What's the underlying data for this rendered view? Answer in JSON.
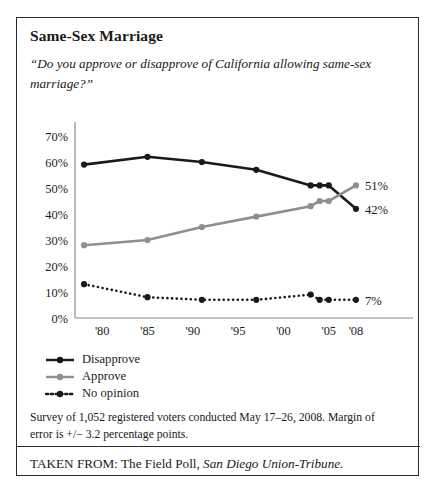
{
  "figure": {
    "title": "Same-Sex Marriage",
    "question": "“Do you approve or disapprove of California allowing same-sex marriage?”",
    "survey_note": "Survey of 1,052 registered voters conducted May 17–26,  2008. Margin of error is +/− 3.2 percentage points.",
    "source_prefix": "TAKEN FROM: The Field Poll, ",
    "source_publication": "San Diego Union-Tribune."
  },
  "colors": {
    "disapprove": "#1a1a1a",
    "approve": "#8f8f8f",
    "no_opinion": "#1a1a1a",
    "axis": "#8a8a8a",
    "frame": "#2b2b2b",
    "text": "#1a1a1a"
  },
  "chart_data": {
    "type": "line",
    "title": "Same-Sex Marriage",
    "subtitle": "“Do you approve or disapprove of California allowing same-sex marriage?”",
    "xlabel": "",
    "ylabel": "",
    "xlim": [
      1977,
      2009
    ],
    "ylim": [
      0,
      70
    ],
    "ytick_labels": [
      "0%",
      "10%",
      "20%",
      "30%",
      "40%",
      "50%",
      "60%",
      "70%"
    ],
    "ytick_values": [
      0,
      10,
      20,
      30,
      40,
      50,
      60,
      70
    ],
    "xtick_labels": [
      "'80",
      "'85",
      "'90",
      "'95",
      "'00",
      "'05",
      "'08"
    ],
    "xtick_values": [
      1980,
      1985,
      1990,
      1995,
      2000,
      2005,
      2008
    ],
    "grid": false,
    "legend_position": "below-left",
    "series": [
      {
        "name": "Disapprove",
        "color": "#1a1a1a",
        "style": "solid",
        "end_label": "42%",
        "x": [
          1978,
          1985,
          1991,
          1997,
          2003,
          2004,
          2005,
          2008
        ],
        "values": [
          59,
          62,
          60,
          57,
          51,
          51,
          51,
          42
        ]
      },
      {
        "name": "Approve",
        "color": "#8f8f8f",
        "style": "solid",
        "end_label": "51%",
        "x": [
          1978,
          1985,
          1991,
          1997,
          2003,
          2004,
          2005,
          2008
        ],
        "values": [
          28,
          30,
          35,
          39,
          43,
          45,
          45,
          51
        ]
      },
      {
        "name": "No opinion",
        "color": "#1a1a1a",
        "style": "dotted",
        "end_label": "7%",
        "x": [
          1978,
          1985,
          1991,
          1997,
          2003,
          2004,
          2005,
          2008
        ],
        "values": [
          13,
          8,
          7,
          7,
          9,
          7,
          7,
          7
        ]
      }
    ]
  },
  "legend": [
    {
      "label": "Disapprove",
      "marker": "line-dot-marker-black"
    },
    {
      "label": "Approve",
      "marker": "line-dot-marker-gray"
    },
    {
      "label": "No opinion",
      "marker": "dotted-line-dot-marker-black"
    }
  ]
}
